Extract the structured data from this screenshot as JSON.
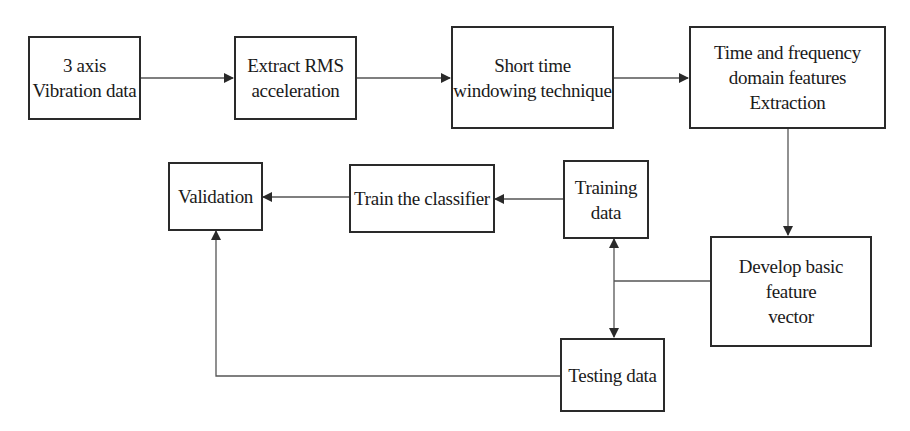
{
  "diagram": {
    "type": "flowchart",
    "colors": {
      "stroke": "#2a2a2a",
      "background": "#ffffff",
      "text": "#1a1a1a"
    },
    "nodes": [
      {
        "id": "vibration",
        "lines": [
          "3 axis",
          "Vibration data"
        ]
      },
      {
        "id": "rms",
        "lines": [
          "Extract RMS",
          "acceleration"
        ]
      },
      {
        "id": "windowing",
        "lines": [
          "Short time",
          "windowing technique"
        ]
      },
      {
        "id": "features",
        "lines": [
          "Time and frequency",
          "domain features Extraction"
        ]
      },
      {
        "id": "feature_vector",
        "lines": [
          "Develop basic feature",
          "vector"
        ]
      },
      {
        "id": "training",
        "lines": [
          "Training",
          "data"
        ]
      },
      {
        "id": "testing",
        "lines": [
          "Testing data"
        ]
      },
      {
        "id": "train_classifier",
        "lines": [
          "Train the classifier"
        ]
      },
      {
        "id": "validation",
        "lines": [
          "Validation"
        ]
      }
    ],
    "edges": [
      {
        "from": "vibration",
        "to": "rms"
      },
      {
        "from": "rms",
        "to": "windowing"
      },
      {
        "from": "windowing",
        "to": "features"
      },
      {
        "from": "features",
        "to": "feature_vector"
      },
      {
        "from": "feature_vector",
        "to": "training"
      },
      {
        "from": "feature_vector",
        "to": "testing"
      },
      {
        "from": "training",
        "to": "train_classifier"
      },
      {
        "from": "train_classifier",
        "to": "validation"
      },
      {
        "from": "testing",
        "to": "validation"
      }
    ]
  }
}
